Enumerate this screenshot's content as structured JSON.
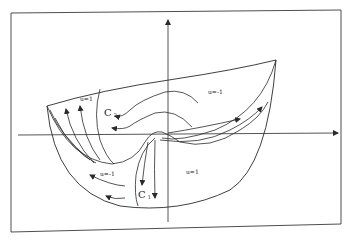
{
  "figure": {
    "colors": {
      "ink": "#2a2a2a",
      "background": "#ffffff",
      "frame": "#3a3a3a"
    },
    "regions": [
      {
        "id": "upper-left",
        "label": "u=1"
      },
      {
        "id": "upper-right",
        "label": "u=-1"
      },
      {
        "id": "lower-left",
        "label": "u=-1"
      },
      {
        "id": "lower-right",
        "label": "u=1"
      }
    ],
    "curves": [
      {
        "id": "c1",
        "label": "C",
        "subscript": "1"
      },
      {
        "id": "c2",
        "label": "C",
        "subscript": "2"
      }
    ],
    "axes": {
      "x_arrow": true,
      "y_arrow": true
    }
  }
}
